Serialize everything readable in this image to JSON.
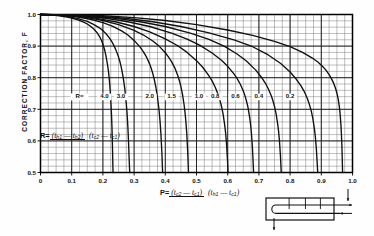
{
  "chart_data": {
    "type": "line",
    "title": "",
    "xlabel": "P",
    "ylabel": "CORRECTION FACTOR, F",
    "xlim": [
      0,
      1.0
    ],
    "ylim": [
      0.5,
      1.0
    ],
    "grid": true,
    "x_major_ticks": [
      "0",
      "0.1",
      "0.2",
      "0.3",
      "0.4",
      "0.5",
      "0.6",
      "0.7",
      "0.8",
      "0.9",
      "1.0"
    ],
    "y_major_ticks": [
      "0.5",
      "0.6",
      "0.7",
      "0.8",
      "0.9",
      "1.0"
    ],
    "x_minor_step": 0.025,
    "y_minor_step": 0.02,
    "legend_position": "inline-on-curves",
    "series_label_prefix": "R=",
    "series": [
      {
        "name": "4.0",
        "R": 4.0,
        "label_x": 0.205,
        "label_y": 0.735,
        "points": [
          [
            0.0,
            1.0
          ],
          [
            0.02,
            0.999
          ],
          [
            0.04,
            0.998
          ],
          [
            0.06,
            0.996
          ],
          [
            0.08,
            0.993
          ],
          [
            0.1,
            0.989
          ],
          [
            0.12,
            0.983
          ],
          [
            0.14,
            0.975
          ],
          [
            0.15,
            0.97
          ],
          [
            0.16,
            0.963
          ],
          [
            0.17,
            0.955
          ],
          [
            0.18,
            0.944
          ],
          [
            0.19,
            0.929
          ],
          [
            0.195,
            0.919
          ],
          [
            0.2,
            0.906
          ],
          [
            0.205,
            0.89
          ],
          [
            0.21,
            0.868
          ],
          [
            0.215,
            0.84
          ],
          [
            0.218,
            0.818
          ],
          [
            0.22,
            0.8
          ],
          [
            0.222,
            0.778
          ],
          [
            0.224,
            0.75
          ],
          [
            0.226,
            0.716
          ],
          [
            0.228,
            0.672
          ],
          [
            0.229,
            0.645
          ],
          [
            0.23,
            0.61
          ],
          [
            0.231,
            0.568
          ],
          [
            0.232,
            0.518
          ],
          [
            0.2325,
            0.5
          ]
        ]
      },
      {
        "name": "3.0",
        "R": 3.0,
        "label_x": 0.258,
        "label_y": 0.735,
        "points": [
          [
            0.0,
            1.0
          ],
          [
            0.03,
            0.999
          ],
          [
            0.06,
            0.997
          ],
          [
            0.09,
            0.993
          ],
          [
            0.12,
            0.987
          ],
          [
            0.15,
            0.978
          ],
          [
            0.17,
            0.969
          ],
          [
            0.19,
            0.957
          ],
          [
            0.2,
            0.949
          ],
          [
            0.21,
            0.939
          ],
          [
            0.22,
            0.927
          ],
          [
            0.23,
            0.912
          ],
          [
            0.24,
            0.892
          ],
          [
            0.25,
            0.866
          ],
          [
            0.255,
            0.849
          ],
          [
            0.26,
            0.828
          ],
          [
            0.265,
            0.801
          ],
          [
            0.27,
            0.766
          ],
          [
            0.275,
            0.718
          ],
          [
            0.278,
            0.679
          ],
          [
            0.28,
            0.645
          ],
          [
            0.282,
            0.602
          ],
          [
            0.284,
            0.546
          ],
          [
            0.286,
            0.5
          ]
        ]
      },
      {
        "name": "2.0",
        "R": 2.0,
        "label_x": 0.35,
        "label_y": 0.735,
        "points": [
          [
            0.0,
            1.0
          ],
          [
            0.04,
            0.999
          ],
          [
            0.08,
            0.997
          ],
          [
            0.12,
            0.992
          ],
          [
            0.16,
            0.985
          ],
          [
            0.2,
            0.974
          ],
          [
            0.23,
            0.963
          ],
          [
            0.26,
            0.948
          ],
          [
            0.28,
            0.935
          ],
          [
            0.3,
            0.918
          ],
          [
            0.32,
            0.896
          ],
          [
            0.33,
            0.882
          ],
          [
            0.34,
            0.865
          ],
          [
            0.35,
            0.843
          ],
          [
            0.355,
            0.829
          ],
          [
            0.36,
            0.813
          ],
          [
            0.365,
            0.793
          ],
          [
            0.37,
            0.769
          ],
          [
            0.375,
            0.738
          ],
          [
            0.38,
            0.697
          ],
          [
            0.383,
            0.664
          ],
          [
            0.386,
            0.621
          ],
          [
            0.389,
            0.563
          ],
          [
            0.391,
            0.512
          ],
          [
            0.3915,
            0.5
          ]
        ]
      },
      {
        "name": "1.5",
        "R": 1.5,
        "label_x": 0.42,
        "label_y": 0.735,
        "points": [
          [
            0.0,
            1.0
          ],
          [
            0.05,
            0.999
          ],
          [
            0.1,
            0.996
          ],
          [
            0.15,
            0.99
          ],
          [
            0.2,
            0.981
          ],
          [
            0.25,
            0.968
          ],
          [
            0.3,
            0.95
          ],
          [
            0.33,
            0.935
          ],
          [
            0.36,
            0.916
          ],
          [
            0.38,
            0.9
          ],
          [
            0.4,
            0.879
          ],
          [
            0.41,
            0.866
          ],
          [
            0.42,
            0.851
          ],
          [
            0.43,
            0.832
          ],
          [
            0.44,
            0.807
          ],
          [
            0.445,
            0.791
          ],
          [
            0.45,
            0.772
          ],
          [
            0.455,
            0.748
          ],
          [
            0.46,
            0.716
          ],
          [
            0.463,
            0.692
          ],
          [
            0.466,
            0.661
          ],
          [
            0.469,
            0.62
          ],
          [
            0.472,
            0.562
          ],
          [
            0.474,
            0.505
          ],
          [
            0.4745,
            0.5
          ]
        ]
      },
      {
        "name": "1.0",
        "R": 1.0,
        "label_x": 0.508,
        "label_y": 0.735,
        "points": [
          [
            0.0,
            1.0
          ],
          [
            0.06,
            0.999
          ],
          [
            0.12,
            0.995
          ],
          [
            0.18,
            0.988
          ],
          [
            0.24,
            0.977
          ],
          [
            0.3,
            0.962
          ],
          [
            0.35,
            0.945
          ],
          [
            0.4,
            0.923
          ],
          [
            0.44,
            0.901
          ],
          [
            0.47,
            0.88
          ],
          [
            0.5,
            0.854
          ],
          [
            0.52,
            0.833
          ],
          [
            0.54,
            0.806
          ],
          [
            0.55,
            0.79
          ],
          [
            0.56,
            0.77
          ],
          [
            0.57,
            0.745
          ],
          [
            0.575,
            0.729
          ],
          [
            0.58,
            0.71
          ],
          [
            0.585,
            0.686
          ],
          [
            0.59,
            0.653
          ],
          [
            0.593,
            0.628
          ],
          [
            0.596,
            0.594
          ],
          [
            0.599,
            0.546
          ],
          [
            0.601,
            0.503
          ],
          [
            0.6015,
            0.5
          ]
        ]
      },
      {
        "name": "0.8",
        "R": 0.8,
        "label_x": 0.56,
        "label_y": 0.735,
        "points": [
          [
            0.0,
            1.0
          ],
          [
            0.07,
            0.999
          ],
          [
            0.14,
            0.995
          ],
          [
            0.21,
            0.988
          ],
          [
            0.28,
            0.977
          ],
          [
            0.35,
            0.962
          ],
          [
            0.42,
            0.941
          ],
          [
            0.47,
            0.922
          ],
          [
            0.51,
            0.903
          ],
          [
            0.55,
            0.878
          ],
          [
            0.58,
            0.855
          ],
          [
            0.6,
            0.836
          ],
          [
            0.62,
            0.812
          ],
          [
            0.63,
            0.798
          ],
          [
            0.64,
            0.78
          ],
          [
            0.65,
            0.758
          ],
          [
            0.655,
            0.744
          ],
          [
            0.66,
            0.727
          ],
          [
            0.665,
            0.706
          ],
          [
            0.67,
            0.677
          ],
          [
            0.673,
            0.655
          ],
          [
            0.676,
            0.625
          ],
          [
            0.679,
            0.583
          ],
          [
            0.681,
            0.544
          ],
          [
            0.683,
            0.5
          ]
        ]
      },
      {
        "name": "0.6",
        "R": 0.6,
        "label_x": 0.625,
        "label_y": 0.735,
        "points": [
          [
            0.0,
            1.0
          ],
          [
            0.08,
            0.999
          ],
          [
            0.16,
            0.995
          ],
          [
            0.24,
            0.988
          ],
          [
            0.32,
            0.977
          ],
          [
            0.4,
            0.962
          ],
          [
            0.48,
            0.941
          ],
          [
            0.54,
            0.921
          ],
          [
            0.59,
            0.899
          ],
          [
            0.63,
            0.875
          ],
          [
            0.66,
            0.853
          ],
          [
            0.69,
            0.824
          ],
          [
            0.71,
            0.799
          ],
          [
            0.72,
            0.784
          ],
          [
            0.73,
            0.765
          ],
          [
            0.74,
            0.742
          ],
          [
            0.745,
            0.727
          ],
          [
            0.75,
            0.709
          ],
          [
            0.755,
            0.686
          ],
          [
            0.76,
            0.655
          ],
          [
            0.763,
            0.631
          ],
          [
            0.766,
            0.599
          ],
          [
            0.769,
            0.554
          ],
          [
            0.771,
            0.512
          ],
          [
            0.7715,
            0.5
          ]
        ]
      },
      {
        "name": "0.4",
        "R": 0.4,
        "label_x": 0.7,
        "label_y": 0.735,
        "points": [
          [
            0.0,
            1.0
          ],
          [
            0.09,
            0.999
          ],
          [
            0.18,
            0.995
          ],
          [
            0.27,
            0.988
          ],
          [
            0.36,
            0.977
          ],
          [
            0.45,
            0.962
          ],
          [
            0.54,
            0.942
          ],
          [
            0.62,
            0.92
          ],
          [
            0.68,
            0.898
          ],
          [
            0.73,
            0.872
          ],
          [
            0.77,
            0.845
          ],
          [
            0.8,
            0.818
          ],
          [
            0.82,
            0.795
          ],
          [
            0.835,
            0.774
          ],
          [
            0.845,
            0.757
          ],
          [
            0.855,
            0.735
          ],
          [
            0.862,
            0.715
          ],
          [
            0.868,
            0.694
          ],
          [
            0.873,
            0.67
          ],
          [
            0.878,
            0.638
          ],
          [
            0.881,
            0.612
          ],
          [
            0.884,
            0.577
          ],
          [
            0.887,
            0.528
          ],
          [
            0.8885,
            0.5
          ]
        ]
      },
      {
        "name": "0.2",
        "R": 0.2,
        "label_x": 0.8,
        "label_y": 0.735,
        "points": [
          [
            0.0,
            1.0
          ],
          [
            0.1,
            0.999
          ],
          [
            0.2,
            0.996
          ],
          [
            0.3,
            0.99
          ],
          [
            0.4,
            0.981
          ],
          [
            0.5,
            0.968
          ],
          [
            0.6,
            0.951
          ],
          [
            0.68,
            0.934
          ],
          [
            0.75,
            0.915
          ],
          [
            0.8,
            0.898
          ],
          [
            0.84,
            0.88
          ],
          [
            0.87,
            0.863
          ],
          [
            0.89,
            0.849
          ],
          [
            0.905,
            0.835
          ],
          [
            0.915,
            0.824
          ],
          [
            0.925,
            0.81
          ],
          [
            0.932,
            0.798
          ],
          [
            0.938,
            0.786
          ],
          [
            0.943,
            0.774
          ],
          [
            0.947,
            0.762
          ],
          [
            0.951,
            0.747
          ],
          [
            0.954,
            0.733
          ],
          [
            0.957,
            0.714
          ],
          [
            0.959,
            0.698
          ],
          [
            0.961,
            0.677
          ],
          [
            0.963,
            0.649
          ],
          [
            0.965,
            0.61
          ],
          [
            0.966,
            0.584
          ],
          [
            0.967,
            0.55
          ],
          [
            0.968,
            0.508
          ],
          [
            0.9683,
            0.5
          ]
        ]
      }
    ]
  },
  "axes": {
    "y_title": "CORRECTION FACTOR, F",
    "x_title_symbol": "P="
  },
  "annotations": {
    "r_inline_prefix": "R=",
    "r_formula": {
      "lead": "R=",
      "numerator_open": "(",
      "numerator": "t",
      "numerator_sub1": "h1",
      "numerator_minus": "—",
      "numerator_t2": "t",
      "numerator_sub2": "h2",
      "numerator_close": ")",
      "denominator_open": "(",
      "denominator": "t",
      "denominator_sub1": "c2",
      "denominator_minus": "—",
      "denominator_t2": "t",
      "denominator_sub2": "c1",
      "denominator_close": ")"
    },
    "p_formula": {
      "lead": "P=",
      "numerator_open": "(",
      "numerator": "t",
      "numerator_sub1": "c2",
      "numerator_minus": "—",
      "numerator_t2": "t",
      "numerator_sub2": "c1",
      "numerator_close": ")",
      "denominator_open": "(",
      "denominator": "t",
      "denominator_sub1": "h1",
      "denominator_minus": "—",
      "denominator_t2": "t",
      "denominator_sub2": "c1",
      "denominator_close": ")"
    }
  },
  "diagram": {
    "name": "one-shell-two-tube-pass-heat-exchanger"
  },
  "colors": {
    "curve": "#101010",
    "grid_minor": "#6f6f6f",
    "grid_major": "#1a1a1a",
    "axis": "#000000",
    "text": "#111111",
    "background": "#fefefe"
  }
}
